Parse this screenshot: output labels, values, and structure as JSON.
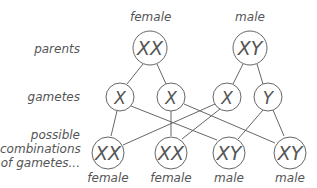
{
  "column_headers": {
    "female": "female",
    "male": "male"
  },
  "row_labels": {
    "parents": "parents",
    "gametes": "gametes",
    "combinations_line1": "possible",
    "combinations_line2": "combinations",
    "combinations_line3": "of gametes..."
  },
  "parents": [
    {
      "genotype": "XX",
      "sex": "female"
    },
    {
      "genotype": "XY",
      "sex": "male"
    }
  ],
  "gametes": [
    "X",
    "X",
    "X",
    "Y"
  ],
  "offspring": [
    {
      "genotype": "XX",
      "sex": "female"
    },
    {
      "genotype": "XX",
      "sex": "female"
    },
    {
      "genotype": "XY",
      "sex": "male"
    },
    {
      "genotype": "XY",
      "sex": "male"
    }
  ],
  "colors": {
    "stroke": "#555555",
    "text": "#555555",
    "background": "#ffffff"
  }
}
